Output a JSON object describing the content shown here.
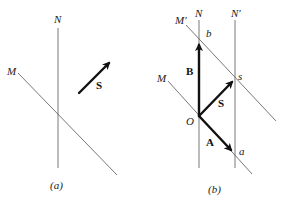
{
  "panels": [
    {
      "id": "a",
      "caption": "(a)",
      "lines": [
        {
          "label": "N",
          "kind": "reference-line"
        },
        {
          "label": "M",
          "kind": "reference-line"
        }
      ],
      "vectors": [
        {
          "label": "S",
          "kind": "vector"
        }
      ]
    },
    {
      "id": "b",
      "caption": "(b)",
      "lines": [
        {
          "label": "N",
          "kind": "reference-line"
        },
        {
          "label": "N′",
          "kind": "reference-line"
        },
        {
          "label": "M",
          "kind": "reference-line"
        },
        {
          "label": "M′",
          "kind": "reference-line"
        }
      ],
      "points": [
        {
          "label": "O"
        },
        {
          "label": "b"
        },
        {
          "label": "s"
        },
        {
          "label": "a"
        }
      ],
      "vectors": [
        {
          "label": "B",
          "from": "O",
          "to": "b"
        },
        {
          "label": "S",
          "from": "O",
          "to": "s"
        },
        {
          "label": "A",
          "from": "O",
          "to": "a"
        }
      ]
    }
  ],
  "colors": {
    "line": "#555555",
    "vector": "#111111",
    "background": "#ffffff"
  }
}
